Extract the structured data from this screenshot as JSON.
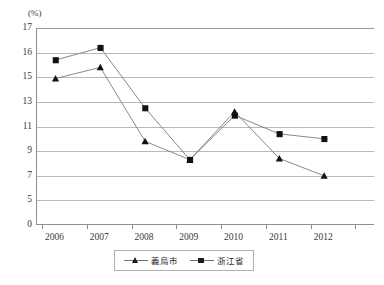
{
  "chart": {
    "unit_label": "(%)",
    "y_tick_labels": [
      "17",
      "16",
      "15",
      "13",
      "11",
      "9",
      "7",
      "5",
      "0"
    ],
    "x_tick_labels": [
      "2006",
      "2007",
      "2008",
      "2009",
      "2010",
      "2011",
      "2012"
    ]
  },
  "legend": {
    "position": "bottom-center",
    "items": [
      {
        "name": "yiwu-city",
        "label": "義烏市",
        "marker": "triangle"
      },
      {
        "name": "zhejiang-province",
        "label": "浙江省",
        "marker": "square"
      }
    ]
  },
  "chart_data": {
    "type": "line",
    "title": "",
    "subtitle": "",
    "xlabel": "",
    "ylabel": "(%)",
    "grid": true,
    "legend_position": "bottom-center",
    "categories": [
      "2006",
      "2007",
      "2008",
      "2009",
      "2010",
      "2011",
      "2012"
    ],
    "y_ticks": [
      0,
      5,
      7,
      9,
      11,
      13,
      15,
      16,
      17
    ],
    "y_axis_note": "non-linear axis: 0-5 compressed, 5-15 in steps of 2, 15-17 in steps of 1",
    "ylim": [
      0,
      17
    ],
    "series": [
      {
        "name": "義烏市",
        "marker": "triangle",
        "color": "#1a1a1a",
        "values": [
          14.9,
          15.4,
          9.8,
          8.3,
          12.2,
          8.4,
          7.0
        ]
      },
      {
        "name": "浙江省",
        "marker": "square",
        "color": "#1a1a1a",
        "values": [
          15.7,
          16.2,
          12.5,
          8.3,
          11.9,
          10.4,
          10.0
        ]
      }
    ]
  }
}
